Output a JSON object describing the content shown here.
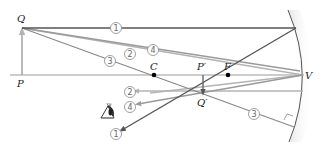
{
  "diagram": {
    "type": "concave-mirror-ray-diagram",
    "labels": {
      "object_top": "Q",
      "object_base": "P",
      "center_of_curvature": "C",
      "focal_point": "F",
      "vertex": "V",
      "image_base": "P′",
      "image_top": "Q′"
    },
    "rays": [
      {
        "id": "1",
        "label": "1",
        "description": "parallel to axis, reflects through F",
        "color": "#555555"
      },
      {
        "id": "2",
        "label": "2",
        "description": "toward vertex V, reflects symmetrically",
        "color": "#aaaaaa"
      },
      {
        "id": "3",
        "label": "3",
        "description": "through C, reflects back on itself",
        "color": "#8a8a8a"
      },
      {
        "id": "4",
        "label": "4",
        "description": "through F, reflects parallel to axis",
        "color": "#9a9a9a"
      }
    ],
    "colors": {
      "axis": "#9a9a9a",
      "mirror": "#555555",
      "mirror_shade": "#e6e6e6",
      "point": "#000000",
      "object_arrow": "#a8a8a8",
      "image_arrow": "#666666"
    },
    "eye_icon": "eye-observer-icon"
  }
}
